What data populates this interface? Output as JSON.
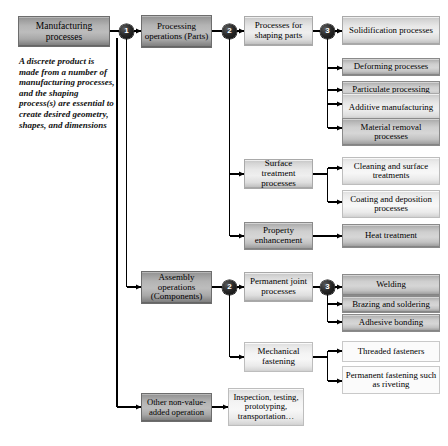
{
  "diagram": {
    "colors": {
      "box_dark": "#b4b4b4",
      "box_medium": "#cfcfcf",
      "box_light": "#e8e8e8",
      "box_pale": "#f4f4f4",
      "box_flat": "#fbfbfb",
      "line": "#000000",
      "badge_fill": "#111111",
      "badge_text": "#ffffff",
      "text": "#000000"
    },
    "root": {
      "label": "Manufacturing processes"
    },
    "note": {
      "text": "A discrete product is made from a number of manufacturing processes, and the shaping process(s) are essential to create desired geometry, shapes, and dimensions"
    },
    "badges": [
      {
        "id": "b1",
        "label": "1"
      },
      {
        "id": "b2a",
        "label": "2"
      },
      {
        "id": "b3a",
        "label": "3"
      },
      {
        "id": "b2b",
        "label": "2"
      },
      {
        "id": "b3b",
        "label": "3"
      }
    ],
    "level1": [
      {
        "id": "processing",
        "label": "Processing operations (Parts)"
      },
      {
        "id": "assembly",
        "label": "Assembly operations (Components)"
      },
      {
        "id": "other",
        "label": "Other non-value-added operation"
      }
    ],
    "level2": [
      {
        "id": "shaping",
        "label": "Processes for shaping parts"
      },
      {
        "id": "surface",
        "label": "Surface treatment processes"
      },
      {
        "id": "property",
        "label": "Property enhancement"
      },
      {
        "id": "permanent",
        "label": "Permanent joint processes"
      },
      {
        "id": "mechanical",
        "label": "Mechanical fastening"
      },
      {
        "id": "inspection",
        "label": "Inspection, testing, prototyping, transportation…"
      }
    ],
    "level3": {
      "shaping": [
        {
          "id": "solidification",
          "label": "Solidification processes"
        },
        {
          "id": "deforming",
          "label": "Deforming processes"
        },
        {
          "id": "particulate",
          "label": "Particulate processing"
        },
        {
          "id": "additive",
          "label": "Additive manufacturing"
        },
        {
          "id": "material-removal",
          "label": "Material removal processes"
        }
      ],
      "surface": [
        {
          "id": "cleaning",
          "label": "Cleaning and surface treatments"
        },
        {
          "id": "coating",
          "label": "Coating and deposition processes"
        }
      ],
      "property": [
        {
          "id": "heat-treatment",
          "label": "Heat treatment"
        }
      ],
      "permanent": [
        {
          "id": "welding",
          "label": "Welding"
        },
        {
          "id": "brazing",
          "label": "Brazing and soldering"
        },
        {
          "id": "adhesive",
          "label": "Adhesive bonding"
        }
      ],
      "mechanical": [
        {
          "id": "threaded",
          "label": "Threaded fasteners"
        },
        {
          "id": "riveting",
          "label": "Permanent fastening such as riveting"
        }
      ]
    }
  }
}
